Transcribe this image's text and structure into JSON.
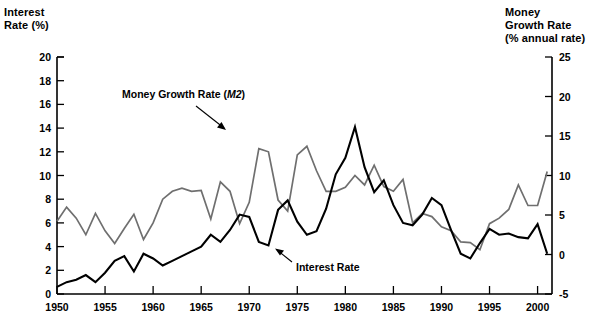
{
  "chart_data": {
    "type": "line",
    "title": "",
    "xlabel": "",
    "left_axis": {
      "label_line1": "Interest",
      "label_line2": "Rate (%)",
      "ylim": [
        0,
        20
      ],
      "ticks": [
        0,
        2,
        4,
        6,
        8,
        10,
        12,
        14,
        16,
        18,
        20
      ],
      "tick_labels": [
        "0",
        "2",
        "4",
        "6",
        "8",
        "10",
        "12",
        "14",
        "16",
        "18",
        "20"
      ]
    },
    "right_axis": {
      "label_line1": "Money",
      "label_line2": "Growth Rate",
      "label_line3": "(% annual rate)",
      "ylim": [
        -5,
        25
      ],
      "ticks": [
        -5,
        0,
        5,
        10,
        15,
        20,
        25
      ],
      "tick_labels": [
        "-5",
        "0",
        "5",
        "10",
        "15",
        "20",
        "25"
      ]
    },
    "x": [
      1950,
      1951,
      1952,
      1953,
      1954,
      1955,
      1956,
      1957,
      1958,
      1959,
      1960,
      1961,
      1962,
      1963,
      1964,
      1965,
      1966,
      1967,
      1968,
      1969,
      1970,
      1971,
      1972,
      1973,
      1974,
      1975,
      1976,
      1977,
      1978,
      1979,
      1980,
      1981,
      1982,
      1983,
      1984,
      1985,
      1986,
      1987,
      1988,
      1989,
      1990,
      1991,
      1992,
      1993,
      1994,
      1995,
      1996,
      1997,
      1998,
      1999,
      2000,
      2001
    ],
    "xlim": [
      1950,
      2001.5
    ],
    "xticks": [
      1950,
      1955,
      1960,
      1965,
      1970,
      1975,
      1980,
      1985,
      1990,
      1995,
      2000
    ],
    "xtick_labels": [
      "1950",
      "1955",
      "1960",
      "1965",
      "1970",
      "1975",
      "1980",
      "1985",
      "1990",
      "1995",
      "2000"
    ],
    "grid": false,
    "legend_position": "inline-annotations",
    "series": [
      {
        "name": "Money Growth Rate (M2)",
        "axis": "right",
        "color": "#6f6f6f",
        "annotation": "Money Growth Rate (M2)",
        "values": [
          4.2,
          6.0,
          4.6,
          2.5,
          5.2,
          3.0,
          1.4,
          3.3,
          5.1,
          1.9,
          4.0,
          7.0,
          8.0,
          8.4,
          8.0,
          8.1,
          4.5,
          9.2,
          8.0,
          3.9,
          6.6,
          13.4,
          13.0,
          6.9,
          5.5,
          12.6,
          13.7,
          10.6,
          8.0,
          8.0,
          8.5,
          10.0,
          8.8,
          11.3,
          8.6,
          8.0,
          9.5,
          4.0,
          5.2,
          4.8,
          3.5,
          3.0,
          1.6,
          1.5,
          0.6,
          3.9,
          4.6,
          5.7,
          8.8,
          6.2,
          6.2,
          10.5
        ]
      },
      {
        "name": "Interest Rate",
        "axis": "left",
        "color": "#000000",
        "annotation": "Interest Rate",
        "values": [
          0.6,
          1.0,
          1.2,
          1.6,
          1.0,
          1.8,
          2.8,
          3.2,
          1.9,
          3.4,
          3.0,
          2.4,
          2.8,
          3.2,
          3.6,
          4.0,
          5.0,
          4.4,
          5.4,
          6.7,
          6.5,
          4.4,
          4.1,
          7.1,
          7.9,
          6.1,
          5.0,
          5.3,
          7.2,
          10.1,
          11.5,
          14.1,
          10.7,
          8.6,
          9.6,
          7.5,
          6.0,
          5.8,
          6.7,
          8.1,
          7.5,
          5.4,
          3.4,
          3.0,
          4.3,
          5.5,
          5.0,
          5.1,
          4.8,
          4.7,
          5.9,
          3.4
        ]
      }
    ]
  }
}
